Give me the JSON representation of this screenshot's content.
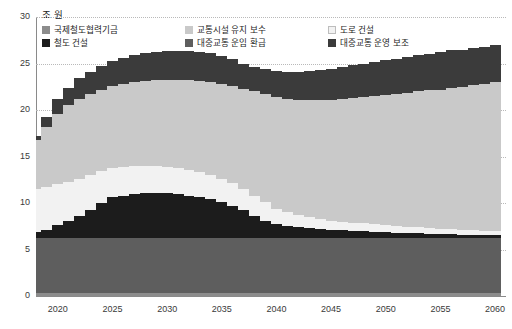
{
  "unit_label": "조 원",
  "legend": {
    "items": [
      {
        "label": "국제철도협력기금",
        "color": "#8c8c8c",
        "key": "intl_rail_fund"
      },
      {
        "label": "교통시설 유지 보수",
        "color": "#c9c9c9",
        "key": "transport_maint"
      },
      {
        "label": "도로 건설",
        "color": "#f2f2f2",
        "key": "road_construction"
      },
      {
        "label": "철도 건설",
        "color": "#1c1c1c",
        "key": "rail_construction"
      },
      {
        "label": "대중교통 운임 환급",
        "color": "#5e5e5e",
        "key": "transit_fare_refund"
      },
      {
        "label": "대중교통 운영 보조",
        "color": "#3b3b3b",
        "key": "transit_operating_subsidy"
      }
    ]
  },
  "chart_data": {
    "type": "area",
    "title": "",
    "subtitle": "",
    "xlabel": "",
    "ylabel": "조 원",
    "xlim": [
      2018,
      2061
    ],
    "ylim": [
      0,
      30
    ],
    "yticks": [
      0,
      5,
      10,
      15,
      20,
      25,
      30
    ],
    "xticks": [
      2020,
      2025,
      2030,
      2035,
      2040,
      2045,
      2050,
      2055,
      2060
    ],
    "grid": true,
    "legend_position": "top-left",
    "stacked": true,
    "stack_order_bottom_to_top": [
      "intl_rail_fund",
      "transit_fare_refund",
      "rail_construction",
      "road_construction",
      "transport_maint",
      "transit_operating_subsidy"
    ],
    "x": [
      2018,
      2019,
      2020,
      2021,
      2022,
      2023,
      2024,
      2025,
      2026,
      2027,
      2028,
      2029,
      2030,
      2031,
      2032,
      2033,
      2034,
      2035,
      2036,
      2037,
      2038,
      2039,
      2040,
      2041,
      2042,
      2043,
      2044,
      2045,
      2046,
      2047,
      2048,
      2049,
      2050,
      2051,
      2052,
      2053,
      2054,
      2055,
      2056,
      2057,
      2058,
      2059,
      2060
    ],
    "series": [
      {
        "name": "국제철도협력기금",
        "color": "#8c8c8c",
        "values": [
          0.3,
          0.3,
          0.3,
          0.3,
          0.3,
          0.3,
          0.3,
          0.3,
          0.3,
          0.3,
          0.3,
          0.3,
          0.3,
          0.3,
          0.3,
          0.3,
          0.3,
          0.3,
          0.3,
          0.3,
          0.3,
          0.3,
          0.3,
          0.3,
          0.3,
          0.3,
          0.3,
          0.3,
          0.3,
          0.3,
          0.3,
          0.3,
          0.3,
          0.3,
          0.3,
          0.3,
          0.3,
          0.3,
          0.3,
          0.3,
          0.3,
          0.3,
          0.3
        ]
      },
      {
        "name": "대중교통 운임 환급",
        "color": "#5e5e5e",
        "values": [
          5.9,
          5.9,
          5.9,
          5.9,
          5.9,
          5.9,
          5.9,
          5.9,
          5.9,
          5.9,
          5.9,
          5.9,
          5.9,
          5.9,
          5.9,
          5.9,
          5.9,
          5.9,
          5.9,
          5.9,
          5.9,
          5.9,
          5.9,
          5.9,
          5.9,
          5.9,
          5.9,
          5.9,
          5.9,
          5.9,
          5.9,
          5.9,
          5.9,
          5.9,
          5.9,
          5.9,
          5.9,
          5.9,
          5.9,
          5.9,
          5.9,
          5.9,
          5.9
        ]
      },
      {
        "name": "철도 건설",
        "color": "#1c1c1c",
        "values": [
          0.7,
          0.9,
          1.4,
          1.9,
          2.4,
          3.1,
          3.8,
          4.4,
          4.6,
          4.8,
          4.9,
          4.9,
          4.9,
          4.8,
          4.6,
          4.4,
          4.2,
          3.9,
          3.5,
          3.0,
          2.4,
          1.9,
          1.5,
          1.3,
          1.2,
          1.1,
          1.0,
          0.9,
          0.9,
          0.8,
          0.8,
          0.7,
          0.7,
          0.6,
          0.6,
          0.6,
          0.5,
          0.5,
          0.5,
          0.4,
          0.4,
          0.4,
          0.4
        ]
      },
      {
        "name": "도로 건설",
        "color": "#f2f2f2",
        "values": [
          4.6,
          4.6,
          4.4,
          4.2,
          4.0,
          3.7,
          3.4,
          3.2,
          3.1,
          3.0,
          2.9,
          2.9,
          2.8,
          2.8,
          2.8,
          2.7,
          2.6,
          2.5,
          2.4,
          2.3,
          2.2,
          2.0,
          1.7,
          1.5,
          1.3,
          1.2,
          1.1,
          1.0,
          0.9,
          0.9,
          0.8,
          0.8,
          0.7,
          0.7,
          0.6,
          0.6,
          0.6,
          0.5,
          0.5,
          0.5,
          0.5,
          0.4,
          0.4
        ]
      },
      {
        "name": "교통시설 유지 보수",
        "color": "#c9c9c9",
        "values": [
          5.3,
          6.5,
          7.6,
          8.2,
          8.6,
          8.7,
          8.7,
          8.8,
          8.9,
          9.0,
          9.1,
          9.2,
          9.3,
          9.4,
          9.6,
          9.8,
          10.0,
          10.2,
          10.5,
          10.8,
          11.2,
          11.6,
          12.0,
          12.2,
          12.4,
          12.6,
          12.8,
          13.0,
          13.2,
          13.4,
          13.6,
          13.8,
          14.0,
          14.2,
          14.4,
          14.6,
          14.8,
          15.0,
          15.2,
          15.4,
          15.6,
          15.8,
          16.0
        ]
      },
      {
        "name": "대중교통 운영 보조",
        "color": "#3b3b3b",
        "values": [
          0.4,
          1.0,
          1.6,
          1.9,
          2.2,
          2.4,
          2.6,
          2.7,
          2.8,
          2.9,
          3.0,
          3.0,
          3.1,
          3.1,
          3.1,
          3.1,
          3.1,
          3.0,
          2.9,
          2.6,
          2.6,
          2.7,
          2.8,
          2.9,
          3.0,
          3.1,
          3.2,
          3.3,
          3.4,
          3.5,
          3.6,
          3.7,
          3.8,
          3.8,
          3.9,
          3.9,
          3.9,
          4.0,
          4.0,
          4.0,
          4.0,
          4.0,
          4.0
        ]
      }
    ],
    "totals_note": "Stacked total rises from ~17 (2018) to ~24 (2030), dips to ~23 (2037), then climbs to ~26.6 (2060)"
  }
}
